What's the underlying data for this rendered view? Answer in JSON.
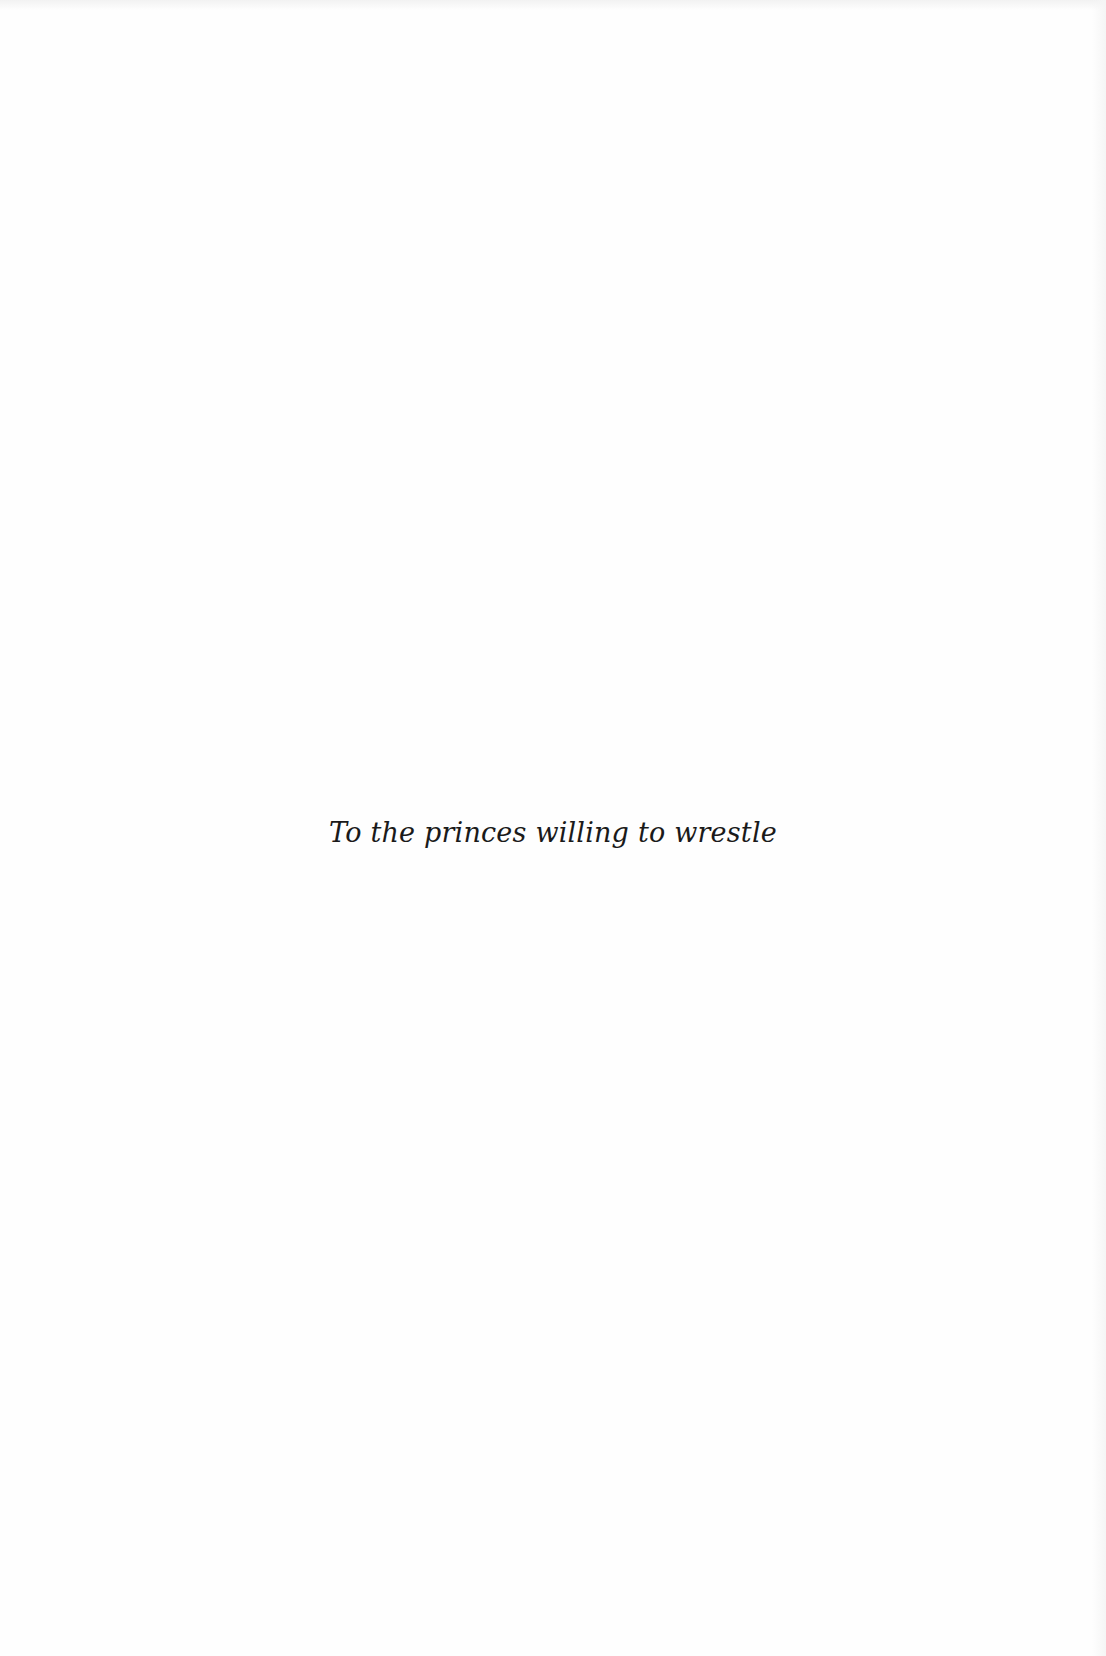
{
  "page": {
    "type": "dedication",
    "dedication_text": "To the princes willing to wrestle"
  }
}
